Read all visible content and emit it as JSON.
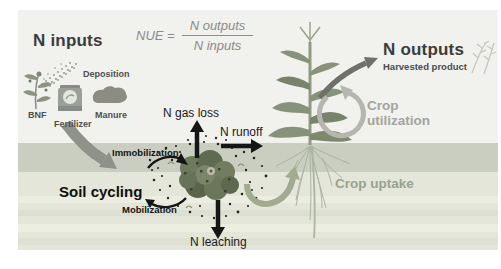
{
  "figure": {
    "left_title": "N inputs",
    "right_title": "N outputs",
    "right_subtitle": "Harvested product",
    "soil_title": "Soil cycling"
  },
  "formula": {
    "lhs": "NUE =",
    "numerator": "N outputs",
    "denominator": "N inputs"
  },
  "inputs": {
    "deposition": "Deposition",
    "bnf": "BNF",
    "fertilizer": "Fertilizer",
    "manure": "Manure"
  },
  "fluxes": {
    "gas_loss": "N gas loss",
    "runoff": "N runoff",
    "leaching": "N leaching",
    "immobilization": "Immobilization",
    "mobilization": "Mobilization"
  },
  "crop": {
    "utilization_line1": "Crop",
    "utilization_line2": "utilization",
    "uptake": "Crop uptake"
  },
  "colors": {
    "sky": "#f1f1ee",
    "soil_top_band": "#c9cec0",
    "soil_lower_band": "#e3e6d9",
    "arrow_black": "#161616",
    "arrow_gray": "#8f928a",
    "arrow_dark_gray": "#6f6f6b",
    "crop_green": "#a0ab90",
    "muted_text": "#a2a49b",
    "organic_matter": "#66714f"
  }
}
